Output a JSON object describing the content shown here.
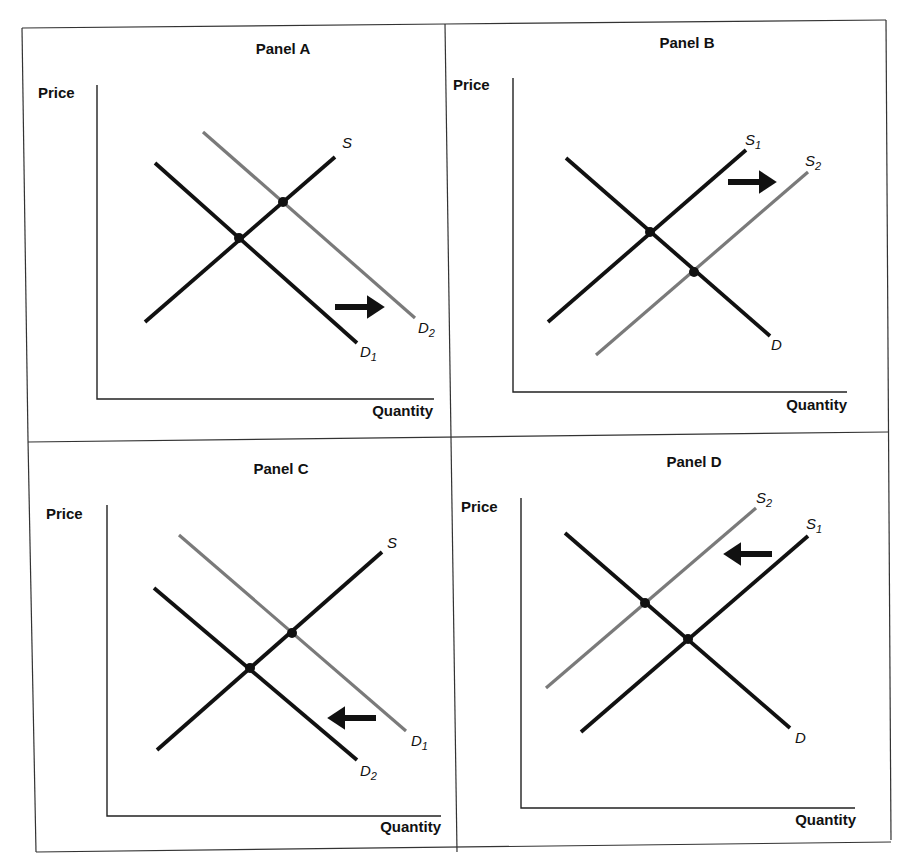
{
  "figure": {
    "frame": {
      "color": "#333333"
    },
    "colors": {
      "black_curve": "#111111",
      "gray_curve": "#7a7a7a",
      "axis": "#222222"
    }
  },
  "panels": [
    {
      "id": "A",
      "title": "Panel A",
      "y_label": "Price",
      "x_label": "Quantity",
      "title_pos": [
        283,
        54
      ],
      "y_label_pos": [
        38,
        98
      ],
      "x_label_pos": [
        433,
        416
      ],
      "axes": {
        "origin": [
          97,
          399
        ],
        "y_top": 85,
        "x_right": 434
      },
      "curves": [
        {
          "name": "D1",
          "base": "D",
          "sub": "1",
          "kind": "demand",
          "color": "black",
          "p1": [
            155,
            163
          ],
          "p2": [
            357,
            343
          ],
          "label_pos": [
            360,
            357
          ]
        },
        {
          "name": "D2",
          "base": "D",
          "sub": "2",
          "kind": "demand",
          "color": "gray",
          "p1": [
            203,
            132
          ],
          "p2": [
            415,
            318
          ],
          "label_pos": [
            418,
            333
          ]
        },
        {
          "name": "S",
          "base": "S",
          "sub": "",
          "kind": "supply",
          "color": "black",
          "p1": [
            145,
            322
          ],
          "p2": [
            335,
            157
          ],
          "label_pos": [
            342,
            148
          ]
        }
      ],
      "equilibria": [
        [
          239,
          238
        ],
        [
          283,
          202
        ]
      ],
      "arrow": {
        "direction": "right",
        "from": [
          335,
          307
        ],
        "to": [
          390,
          307
        ]
      },
      "description": "Demand shifts right from D1 to D2"
    },
    {
      "id": "B",
      "title": "Panel B",
      "y_label": "Price",
      "x_label": "Quantity",
      "title_pos": [
        687,
        48
      ],
      "y_label_pos": [
        453,
        90
      ],
      "x_label_pos": [
        847,
        410
      ],
      "axes": {
        "origin": [
          513,
          392
        ],
        "y_top": 78,
        "x_right": 847
      },
      "curves": [
        {
          "name": "D",
          "base": "D",
          "sub": "",
          "kind": "demand",
          "color": "black",
          "p1": [
            566,
            158
          ],
          "p2": [
            770,
            336
          ],
          "label_pos": [
            771,
            350
          ]
        },
        {
          "name": "S1",
          "base": "S",
          "sub": "1",
          "kind": "supply",
          "color": "black",
          "p1": [
            548,
            322
          ],
          "p2": [
            746,
            150
          ],
          "label_pos": [
            745,
            145
          ]
        },
        {
          "name": "S2",
          "base": "S",
          "sub": "2",
          "kind": "supply",
          "color": "gray",
          "p1": [
            596,
            355
          ],
          "p2": [
            808,
            172
          ],
          "label_pos": [
            805,
            166
          ]
        }
      ],
      "equilibria": [
        [
          650,
          232
        ],
        [
          694,
          272
        ]
      ],
      "arrow": {
        "direction": "right",
        "from": [
          728,
          182
        ],
        "to": [
          782,
          182
        ]
      },
      "description": "Supply shifts right from S1 to S2"
    },
    {
      "id": "C",
      "title": "Panel C",
      "y_label": "Price",
      "x_label": "Quantity",
      "title_pos": [
        281,
        474
      ],
      "y_label_pos": [
        46,
        519
      ],
      "x_label_pos": [
        441,
        832
      ],
      "axes": {
        "origin": [
          107,
          816
        ],
        "y_top": 505,
        "x_right": 441
      },
      "curves": [
        {
          "name": "D1",
          "base": "D",
          "sub": "1",
          "kind": "demand",
          "color": "gray",
          "p1": [
            179,
            535
          ],
          "p2": [
            406,
            731
          ],
          "label_pos": [
            411,
            746
          ]
        },
        {
          "name": "D2",
          "base": "D",
          "sub": "2",
          "kind": "demand",
          "color": "black",
          "p1": [
            154,
            588
          ],
          "p2": [
            357,
            760
          ],
          "label_pos": [
            360,
            776
          ]
        },
        {
          "name": "S",
          "base": "S",
          "sub": "",
          "kind": "supply",
          "color": "black",
          "p1": [
            157,
            750
          ],
          "p2": [
            382,
            552
          ],
          "label_pos": [
            387,
            548
          ]
        }
      ],
      "equilibria": [
        [
          250,
          668
        ],
        [
          292,
          633
        ]
      ],
      "arrow": {
        "direction": "left",
        "from": [
          376,
          718
        ],
        "to": [
          322,
          718
        ]
      },
      "description": "Demand shifts left from D1 to D2"
    },
    {
      "id": "D",
      "title": "Panel D",
      "y_label": "Price",
      "x_label": "Quantity",
      "title_pos": [
        694,
        467
      ],
      "y_label_pos": [
        461,
        512
      ],
      "x_label_pos": [
        856,
        825
      ],
      "axes": {
        "origin": [
          521,
          808
        ],
        "y_top": 498,
        "x_right": 855
      },
      "curves": [
        {
          "name": "D",
          "base": "D",
          "sub": "",
          "kind": "demand",
          "color": "black",
          "p1": [
            565,
            533
          ],
          "p2": [
            790,
            728
          ],
          "label_pos": [
            795,
            743
          ]
        },
        {
          "name": "S1",
          "base": "S",
          "sub": "1",
          "kind": "supply",
          "color": "black",
          "p1": [
            581,
            732
          ],
          "p2": [
            808,
            536
          ],
          "label_pos": [
            806,
            529
          ]
        },
        {
          "name": "S2",
          "base": "S",
          "sub": "2",
          "kind": "supply",
          "color": "gray",
          "p1": [
            546,
            688
          ],
          "p2": [
            756,
            508
          ],
          "label_pos": [
            756,
            503
          ]
        }
      ],
      "equilibria": [
        [
          645,
          603
        ],
        [
          688,
          639
        ]
      ],
      "arrow": {
        "direction": "left",
        "from": [
          772,
          554
        ],
        "to": [
          718,
          554
        ]
      },
      "description": "Supply shifts left from S1 to S2"
    }
  ]
}
